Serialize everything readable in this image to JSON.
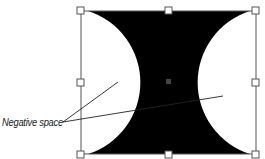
{
  "diagram": {
    "title": "",
    "label": "Negative space",
    "shape": "hourglass-concave-rectangle",
    "colors": {
      "fill": "#000000",
      "frame": "#555555",
      "handle_fill": "#ffffff",
      "handle_stroke": "#555555",
      "center_handle": "#444444",
      "leader_line": "#222222"
    },
    "handles": [
      "top-left",
      "top-center",
      "top-right",
      "middle-left",
      "center",
      "middle-right",
      "bottom-left",
      "bottom-center",
      "bottom-right"
    ]
  }
}
